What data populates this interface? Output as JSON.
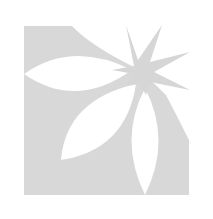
{
  "image": {
    "description": "Flower logo mark: gray square-like field with three white lens-shaped petals and a gray eight-pointed star",
    "background_color": "#ffffff",
    "fill_color": "#d8d8d8",
    "petal_color": "#ffffff",
    "star_color": "#d6d6d6"
  },
  "logo": {
    "petals": [
      {
        "name": "left-petal",
        "orientation": "horizontal"
      },
      {
        "name": "lower-left-petal",
        "orientation": "diagonal"
      },
      {
        "name": "bottom-petal",
        "orientation": "vertical"
      }
    ],
    "star": {
      "points": 8
    }
  }
}
